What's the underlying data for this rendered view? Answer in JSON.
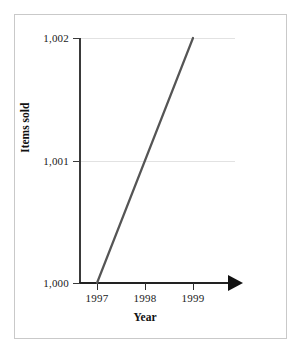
{
  "chart_data": {
    "type": "line",
    "title": "",
    "xlabel": "Year",
    "ylabel": "Items sold",
    "categories": [
      "1997",
      "1998",
      "1999"
    ],
    "x": [
      1997,
      1998,
      1999
    ],
    "xlim": [
      1996.5,
      1999.75
    ],
    "ylim": [
      1000,
      1002
    ],
    "yticks": [
      1000,
      1001,
      1002
    ],
    "ytick_labels": [
      "1,000",
      "1,001",
      "1,002"
    ],
    "xtick_labels": [
      "1997",
      "1998",
      "1999"
    ],
    "grid": "horizontal",
    "legend": "none",
    "series": [
      {
        "name": "Items sold",
        "values": [
          1000,
          1001,
          1002
        ],
        "color": "#555555"
      }
    ],
    "annotations": {
      "x_axis_arrowhead": "true",
      "y_axis_tick_labels_right_aligned": "true"
    },
    "colors": {
      "series_line": "#555555",
      "axis": "#2e2e2e",
      "gridline": "#e2e2e2",
      "frame": "#c9c9c9",
      "background": "#ffffff",
      "text": "#1a1a1a"
    }
  },
  "axes": {
    "y_ticks": [
      {
        "label": "1,002",
        "value": 1002
      },
      {
        "label": "1,001",
        "value": 1001
      },
      {
        "label": "1,000",
        "value": 1000
      }
    ],
    "x_ticks": [
      {
        "label": "1997",
        "value": 1997
      },
      {
        "label": "1998",
        "value": 1998
      },
      {
        "label": "1999",
        "value": 1999
      }
    ],
    "x_title": "Year",
    "y_title": "Items sold"
  }
}
